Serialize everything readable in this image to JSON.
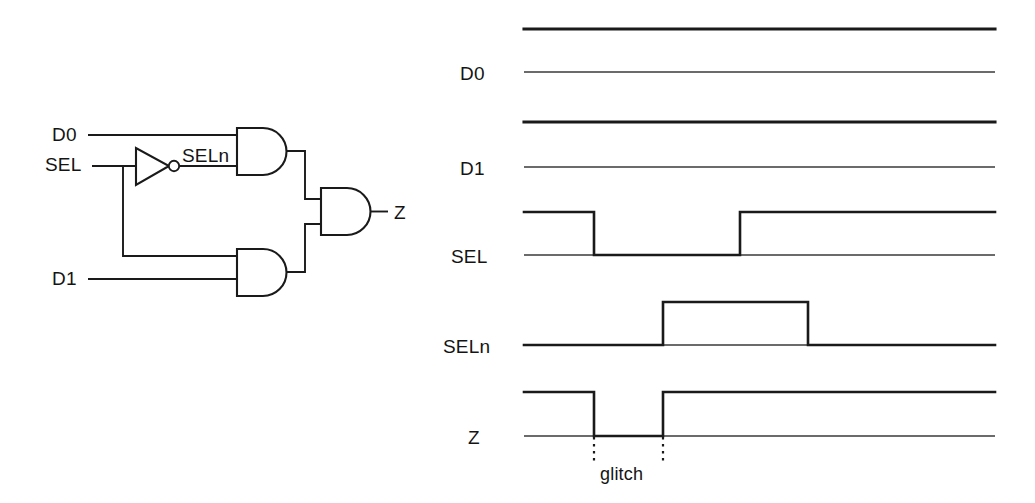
{
  "figure": {
    "stroke_color": "#1a1a1a",
    "background_color": "#ffffff"
  },
  "circuit": {
    "name": "2-to-1 multiplexer gate schematic",
    "input_labels": [
      {
        "id": "d0",
        "text": "D0",
        "x": 52,
        "y": 124
      },
      {
        "id": "sel",
        "text": "SEL",
        "x": 45,
        "y": 154
      },
      {
        "id": "d1",
        "text": "D1",
        "x": 52,
        "y": 268
      }
    ],
    "internal_labels": [
      {
        "id": "seln",
        "text": "SELn",
        "x": 182,
        "y": 145
      }
    ],
    "output_labels": [
      {
        "id": "z",
        "text": "Z",
        "x": 394,
        "y": 202
      }
    ],
    "gates": [
      {
        "id": "inverter",
        "type": "NOT",
        "label": "inverter-gate"
      },
      {
        "id": "and-top",
        "type": "AND",
        "label": "and-gate-top"
      },
      {
        "id": "and-bottom",
        "type": "AND",
        "label": "and-gate-bottom"
      },
      {
        "id": "and-output",
        "type": "AND",
        "label": "and-gate-output"
      }
    ]
  },
  "timing": {
    "name": "timing waveform diagram",
    "x_start": 524,
    "x_end": 995,
    "signals": [
      {
        "id": "d0",
        "label": "D0",
        "label_x": 460,
        "label_y": 63,
        "high_y": 29,
        "low_y": 72,
        "value": "constant high",
        "transitions": []
      },
      {
        "id": "d1",
        "label": "D1",
        "label_x": 460,
        "label_y": 158,
        "high_y": 122,
        "low_y": 167,
        "value": "constant high",
        "transitions": []
      },
      {
        "id": "sel",
        "label": "SEL",
        "label_x": 451,
        "label_y": 246,
        "high_y": 212,
        "low_y": 255,
        "value": "high, low pulse, high",
        "transitions": [
          {
            "x": 594,
            "edge": "falling"
          },
          {
            "x": 740,
            "edge": "rising"
          }
        ]
      },
      {
        "id": "seln",
        "label": "SELn",
        "label_x": 443,
        "label_y": 336,
        "high_y": 302,
        "low_y": 345,
        "value": "low, high pulse, low",
        "transitions": [
          {
            "x": 663,
            "edge": "rising"
          },
          {
            "x": 808,
            "edge": "falling"
          }
        ]
      },
      {
        "id": "z",
        "label": "Z",
        "label_x": 468,
        "label_y": 427,
        "high_y": 392,
        "low_y": 436,
        "value": "high, glitch low, high",
        "transitions": [
          {
            "x": 594,
            "edge": "falling"
          },
          {
            "x": 663,
            "edge": "rising"
          }
        ]
      }
    ],
    "annotations": [
      {
        "id": "glitch",
        "text": "glitch",
        "text_x": 600,
        "text_y": 464,
        "marker_x_start": 594,
        "marker_x_end": 663,
        "marker_y_top": 436,
        "marker_y_bottom": 463
      }
    ]
  }
}
